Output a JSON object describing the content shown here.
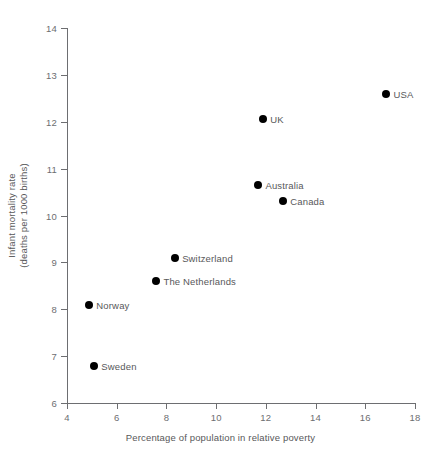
{
  "chart_data": {
    "type": "scatter",
    "title": "",
    "xlabel": "Percentage of population in relative poverty",
    "ylabel_line1": "Infant mortality rate",
    "ylabel_line2": "(deaths per 1000 births)",
    "xlim": [
      4,
      18
    ],
    "ylim": [
      6,
      14
    ],
    "xticks": [
      4,
      6,
      8,
      10,
      12,
      14,
      16,
      18
    ],
    "yticks": [
      6,
      7,
      8,
      9,
      10,
      11,
      12,
      13,
      14
    ],
    "xtick_labels": [
      "4",
      "6",
      "8",
      "10",
      "12",
      "14",
      "16",
      "18"
    ],
    "ytick_labels": [
      "6",
      "7",
      "8",
      "9",
      "10",
      "11",
      "12",
      "13",
      "14"
    ],
    "grid": false,
    "legend": false,
    "marker_color": "#000000",
    "axis_color": "#6d6e71",
    "text_color": "#58585a",
    "points": [
      {
        "label": "Sweden",
        "x": 5.1,
        "y": 6.8,
        "label_pos": "right"
      },
      {
        "label": "Norway",
        "x": 4.9,
        "y": 8.1,
        "label_pos": "right"
      },
      {
        "label": "The Netherlands",
        "x": 7.6,
        "y": 8.6,
        "label_pos": "right"
      },
      {
        "label": "Switzerland",
        "x": 8.35,
        "y": 9.1,
        "label_pos": "right"
      },
      {
        "label": "Canada",
        "x": 12.7,
        "y": 10.3,
        "label_pos": "right"
      },
      {
        "label": "Australia",
        "x": 11.7,
        "y": 10.65,
        "label_pos": "right"
      },
      {
        "label": "UK",
        "x": 11.9,
        "y": 12.05,
        "label_pos": "right"
      },
      {
        "label": "USA",
        "x": 16.85,
        "y": 12.6,
        "label_pos": "right"
      }
    ]
  }
}
